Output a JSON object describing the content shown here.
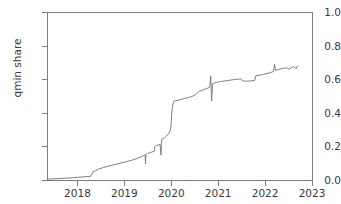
{
  "chart_data": {
    "type": "line",
    "title": "",
    "xlabel": "",
    "ylabel": "qmin share",
    "xlim": [
      2017.35,
      2023.0
    ],
    "ylim": [
      0.0,
      1.0
    ],
    "grid": false,
    "legend": null,
    "line_color": "#7f7f7f",
    "x_tick_labels": [
      "2018",
      "2019",
      "2020",
      "2021",
      "2022",
      "2023"
    ],
    "x_tick_values": [
      2018,
      2019,
      2020,
      2021,
      2022,
      2023
    ],
    "y_tick_labels": [
      "0.0",
      "0.2",
      "0.4",
      "0.6",
      "0.8",
      "1.0"
    ],
    "y_tick_values": [
      0.0,
      0.2,
      0.4,
      0.6,
      0.8,
      1.0
    ],
    "series": [
      {
        "name": "qmin share",
        "x": [
          2017.38,
          2017.5,
          2017.62,
          2017.75,
          2017.88,
          2017.97,
          2018.05,
          2018.15,
          2018.24,
          2018.28,
          2018.3,
          2018.33,
          2018.38,
          2018.45,
          2018.55,
          2018.65,
          2018.75,
          2018.85,
          2018.95,
          2019.05,
          2019.15,
          2019.25,
          2019.33,
          2019.4,
          2019.44,
          2019.45,
          2019.46,
          2019.47,
          2019.5,
          2019.55,
          2019.6,
          2019.64,
          2019.65,
          2019.66,
          2019.68,
          2019.72,
          2019.76,
          2019.78,
          2019.79,
          2019.8,
          2019.82,
          2019.86,
          2019.9,
          2019.94,
          2019.97,
          2019.99,
          2020.0,
          2020.01,
          2020.03,
          2020.06,
          2020.1,
          2020.16,
          2020.22,
          2020.3,
          2020.38,
          2020.45,
          2020.52,
          2020.56,
          2020.58,
          2020.6,
          2020.64,
          2020.7,
          2020.76,
          2020.82,
          2020.84,
          2020.85,
          2020.86,
          2020.88,
          2020.92,
          2020.98,
          2021.05,
          2021.15,
          2021.25,
          2021.35,
          2021.42,
          2021.48,
          2021.52,
          2021.6,
          2021.7,
          2021.78,
          2021.8,
          2021.88,
          2021.96,
          2022.04,
          2022.12,
          2022.18,
          2022.2,
          2022.22,
          2022.28,
          2022.34,
          2022.4,
          2022.46,
          2022.52,
          2022.58,
          2022.62,
          2022.66,
          2022.68,
          2022.7
        ],
        "y": [
          0.005,
          0.007,
          0.009,
          0.011,
          0.013,
          0.015,
          0.017,
          0.019,
          0.021,
          0.022,
          0.03,
          0.048,
          0.055,
          0.065,
          0.074,
          0.082,
          0.089,
          0.096,
          0.103,
          0.11,
          0.117,
          0.126,
          0.135,
          0.143,
          0.15,
          0.095,
          0.152,
          0.155,
          0.158,
          0.163,
          0.168,
          0.172,
          0.2,
          0.203,
          0.205,
          0.208,
          0.212,
          0.148,
          0.215,
          0.245,
          0.248,
          0.252,
          0.262,
          0.275,
          0.29,
          0.31,
          0.35,
          0.4,
          0.445,
          0.47,
          0.472,
          0.476,
          0.48,
          0.486,
          0.492,
          0.498,
          0.508,
          0.52,
          0.524,
          0.528,
          0.532,
          0.538,
          0.545,
          0.552,
          0.62,
          0.556,
          0.47,
          0.572,
          0.578,
          0.582,
          0.586,
          0.59,
          0.594,
          0.598,
          0.6,
          0.602,
          0.59,
          0.588,
          0.59,
          0.592,
          0.62,
          0.624,
          0.628,
          0.634,
          0.64,
          0.646,
          0.69,
          0.652,
          0.658,
          0.662,
          0.665,
          0.668,
          0.66,
          0.672,
          0.674,
          0.662,
          0.676,
          0.678
        ]
      }
    ]
  }
}
